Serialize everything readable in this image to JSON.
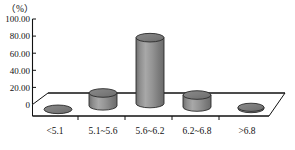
{
  "chart_data": {
    "type": "bar",
    "title": "",
    "subtitle": "",
    "xlabel": "",
    "ylabel": "",
    "unit_label": "（%）",
    "categories": [
      "<5.1",
      "5.1~5.6",
      "5.6~6.2",
      "6.2~6.8",
      ">6.8"
    ],
    "values": [
      1.0,
      15.0,
      77.0,
      14.0,
      1.5
    ],
    "ylim": [
      0,
      100
    ],
    "ytick_values": [
      0,
      20,
      40,
      60,
      80,
      100
    ],
    "ytick_labels": [
      "0",
      "20.00",
      "40.00",
      "60.00",
      "80.00",
      "100.00"
    ],
    "grid": false,
    "legend": false,
    "legend_position": "none",
    "style": "3d-cylinder",
    "series": [
      {
        "name": "",
        "values": [
          1.0,
          15.0,
          77.0,
          14.0,
          1.5
        ]
      }
    ],
    "colors": {
      "bar_fill": "#8c8c8c",
      "bar_fill_light": "#b4b4b4",
      "bar_fill_dark": "#6e6e6e",
      "bar_cap": "#7a7a7a",
      "bar_stroke": "#2b2b2b",
      "axis": "#111111",
      "floor": "#ffffff",
      "floor_stroke": "#111111",
      "background": "#ffffff",
      "text": "#111111"
    }
  }
}
